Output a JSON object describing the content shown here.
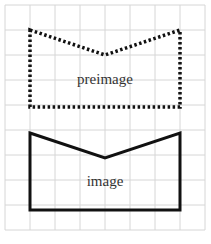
{
  "diagram": {
    "grid": {
      "x0": 5,
      "y0": 5,
      "cell": 25,
      "cols": 8,
      "rows": 9,
      "color": "#d6d6d6"
    },
    "preimage": {
      "label": "preimage",
      "style": "dotted",
      "points": "30,30 105,55 180,30 180,107 30,107",
      "label_pos": [
        105,
        84
      ]
    },
    "image": {
      "label": "image",
      "style": "solid",
      "points": "30,133 105,158 180,133 180,210 30,210",
      "label_pos": [
        105,
        186
      ]
    },
    "stroke_color": "#111111"
  }
}
